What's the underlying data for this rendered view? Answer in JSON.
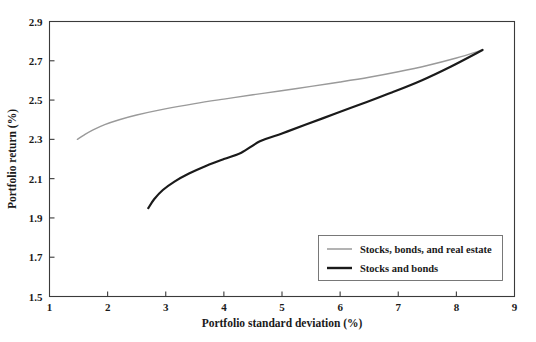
{
  "chart_data": {
    "type": "line",
    "title": "",
    "xlabel": "Portfolio standard deviation (%)",
    "ylabel": "Portfolio return (%)",
    "xlim": [
      1,
      9
    ],
    "ylim": [
      1.5,
      2.9
    ],
    "xticks": [
      "1",
      "2",
      "3",
      "4",
      "5",
      "6",
      "7",
      "8",
      "9"
    ],
    "yticks": [
      "1.5",
      "1.7",
      "1.9",
      "2.1",
      "2.3",
      "2.5",
      "2.7",
      "2.9"
    ],
    "grid": false,
    "legend_position": "lower-right-inside",
    "series": [
      {
        "name": "Stocks, bonds, and real estate",
        "color": "#9a9a9a",
        "width": 1.4,
        "points": [
          [
            1.48,
            2.3
          ],
          [
            1.6,
            2.323
          ],
          [
            1.75,
            2.348
          ],
          [
            1.95,
            2.375
          ],
          [
            2.2,
            2.4
          ],
          [
            2.5,
            2.424
          ],
          [
            2.99,
            2.455
          ],
          [
            3.5,
            2.482
          ],
          [
            4.0,
            2.505
          ],
          [
            4.5,
            2.527
          ],
          [
            4.96,
            2.546
          ],
          [
            5.5,
            2.57
          ],
          [
            6.0,
            2.592
          ],
          [
            6.5,
            2.616
          ],
          [
            7.0,
            2.644
          ],
          [
            7.5,
            2.676
          ],
          [
            8.0,
            2.714
          ],
          [
            8.45,
            2.755
          ]
        ]
      },
      {
        "name": "Stocks and bonds",
        "color": "#1a1a1a",
        "width": 2.2,
        "points": [
          [
            2.7,
            1.95
          ],
          [
            2.8,
            1.995
          ],
          [
            2.95,
            2.042
          ],
          [
            3.15,
            2.085
          ],
          [
            3.4,
            2.126
          ],
          [
            3.7,
            2.166
          ],
          [
            4.0,
            2.2
          ],
          [
            4.3,
            2.232
          ],
          [
            4.62,
            2.29
          ],
          [
            5.0,
            2.33
          ],
          [
            5.4,
            2.374
          ],
          [
            5.91,
            2.43
          ],
          [
            6.4,
            2.484
          ],
          [
            6.9,
            2.54
          ],
          [
            7.4,
            2.6
          ],
          [
            7.9,
            2.67
          ],
          [
            8.45,
            2.755
          ]
        ]
      }
    ]
  },
  "legend": {
    "items": [
      {
        "label": "Stocks, bonds, and real estate",
        "color": "#9a9a9a",
        "width": 1.5
      },
      {
        "label": "Stocks and bonds",
        "color": "#1a1a1a",
        "width": 2.4
      }
    ]
  }
}
